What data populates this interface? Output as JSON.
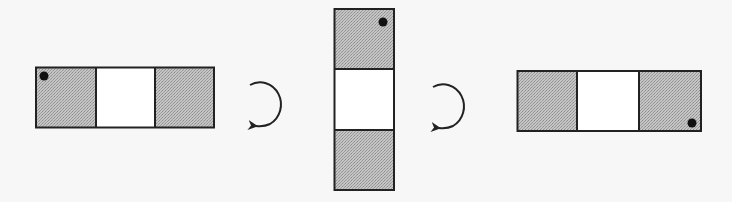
{
  "diagram": {
    "colors": {
      "background": "#f7f7f7",
      "outline": "#222222",
      "shaded": "#b8b8b8",
      "empty": "#ffffff",
      "dot": "#111111",
      "arrow": "#222222"
    },
    "strips": [
      {
        "id": "strip-1",
        "orientation": "horizontal",
        "cells": [
          "shaded",
          "empty",
          "shaded"
        ],
        "dot_position": "top-left of first cell"
      },
      {
        "id": "strip-2",
        "orientation": "vertical",
        "cells": [
          "shaded",
          "empty",
          "shaded"
        ],
        "dot_position": "top-right of first cell"
      },
      {
        "id": "strip-3",
        "orientation": "horizontal",
        "cells": [
          "shaded",
          "empty",
          "shaded"
        ],
        "dot_position": "bottom-right of last cell"
      }
    ],
    "arrows": [
      {
        "id": "rotate-arrow-1",
        "direction": "clockwise",
        "between": [
          "strip-1",
          "strip-2"
        ]
      },
      {
        "id": "rotate-arrow-2",
        "direction": "clockwise",
        "between": [
          "strip-2",
          "strip-3"
        ]
      }
    ]
  }
}
